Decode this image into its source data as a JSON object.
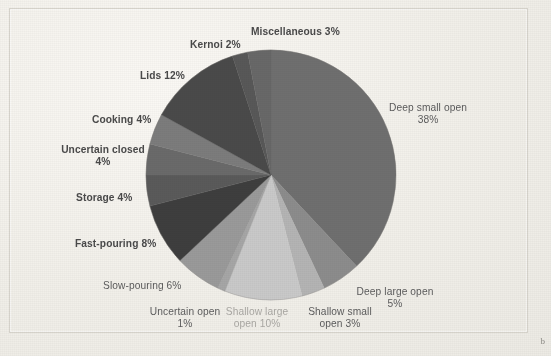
{
  "figure": {
    "marker": "b",
    "background_color": "#f1efe9",
    "frame_color": "#d6d3cb"
  },
  "chart_data": {
    "type": "pie",
    "title": "",
    "subtitle": "",
    "xlabel": "",
    "ylabel": "",
    "legend_position": "none",
    "grid": false,
    "units": "percent",
    "start_angle_deg": 0,
    "direction": "clockwise",
    "center": {
      "x": 271,
      "y": 175
    },
    "radius": 125,
    "total": 100,
    "categories": [
      "Deep small open",
      "Deep large open",
      "Shallow small open",
      "Shallow large open",
      "Uncertain open",
      "Slow-pouring",
      "Fast-pouring",
      "Storage",
      "Uncertain closed",
      "Cooking",
      "Lids",
      "Kernoi",
      "Miscellaneous"
    ],
    "values": [
      38,
      5,
      3,
      10,
      1,
      6,
      8,
      4,
      4,
      4,
      12,
      2,
      3
    ],
    "colors": [
      "#6f6f6f",
      "#8c8c8c",
      "#b4b4b4",
      "#c9c9c9",
      "#a6a6a6",
      "#9a9a9a",
      "#3e3e3e",
      "#5a5a5a",
      "#6a6a6a",
      "#7c7c7c",
      "#4a4a4a",
      "#585858",
      "#686868"
    ],
    "slices": [
      {
        "label": "Deep small open",
        "value": 38,
        "percent_text": "38%",
        "color": "#6f6f6f"
      },
      {
        "label": "Deep large open",
        "value": 5,
        "percent_text": "5%",
        "color": "#8c8c8c"
      },
      {
        "label": "Shallow small open",
        "value": 3,
        "percent_text": "3%",
        "color": "#b4b4b4"
      },
      {
        "label": "Shallow large open",
        "value": 10,
        "percent_text": "10%",
        "color": "#c9c9c9"
      },
      {
        "label": "Uncertain open",
        "value": 1,
        "percent_text": "1%",
        "color": "#a6a6a6"
      },
      {
        "label": "Slow-pouring",
        "value": 6,
        "percent_text": "6%",
        "color": "#9a9a9a"
      },
      {
        "label": "Fast-pouring",
        "value": 8,
        "percent_text": "8%",
        "color": "#3e3e3e"
      },
      {
        "label": "Storage",
        "value": 4,
        "percent_text": "4%",
        "color": "#5a5a5a"
      },
      {
        "label": "Uncertain closed",
        "value": 4,
        "percent_text": "4%",
        "color": "#6a6a6a"
      },
      {
        "label": "Cooking",
        "value": 4,
        "percent_text": "4%",
        "color": "#7c7c7c"
      },
      {
        "label": "Lids",
        "value": 12,
        "percent_text": "12%",
        "color": "#4a4a4a"
      },
      {
        "label": "Kernoi",
        "value": 2,
        "percent_text": "2%",
        "color": "#585858"
      },
      {
        "label": "Miscellaneous",
        "value": 3,
        "percent_text": "3%",
        "color": "#686868"
      }
    ]
  },
  "labels": {
    "miscellaneous": "Miscellaneous  3%",
    "kernoi": "Kernoi 2%",
    "lids": "Lids 12%",
    "cooking": "Cooking  4%",
    "uncertain_closed_line1": "Uncertain closed",
    "uncertain_closed_line2": "4%",
    "storage": "Storage 4%",
    "fast_pouring": "Fast-pouring 8%",
    "slow_pouring": "Slow-pouring  6%",
    "uncertain_open_line1": "Uncertain open",
    "uncertain_open_line2": "1%",
    "shallow_large_open_line1": "Shallow large",
    "shallow_large_open_line2": "open 10%",
    "shallow_small_open_line1": "Shallow small",
    "shallow_small_open_line2": "open 3%",
    "deep_large_open_line1": "Deep large open",
    "deep_large_open_line2": "5%",
    "deep_small_open_line1": "Deep small open",
    "deep_small_open_line2": "38%"
  }
}
